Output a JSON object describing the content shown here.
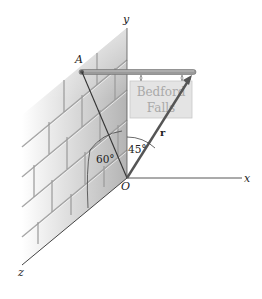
{
  "figure": {
    "type": "3D vector diagram",
    "axes": {
      "x_label": "x",
      "y_label": "y",
      "z_label": "z",
      "origin_label": "O"
    },
    "point_a_label": "A",
    "vector_label": "r",
    "angles": {
      "angle_1": "60°",
      "angle_2": "45°"
    },
    "sign": {
      "line1": "Bedford",
      "line2": "Falls"
    },
    "colors": {
      "wall_gradient_light": "#ffffff",
      "wall_gradient_dark": "#b8b8b8",
      "rod": "#8c8c8c",
      "vector": "#555555",
      "sign_fill": "#e2e2e2",
      "sign_text": "#a9a9a9"
    }
  }
}
